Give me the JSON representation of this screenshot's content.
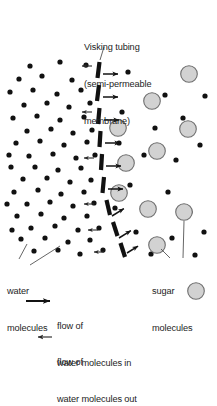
{
  "figure": {
    "title_lines": [
      "Visking tubing",
      "(semi-permeable",
      "membrane)"
    ],
    "title_text": "Visking tubing (semi-permeable membrane)",
    "caption_faint": "",
    "background_color": "#ffffff",
    "ink_color": "#1a1a1a"
  },
  "labels": {
    "water": {
      "line1": "water",
      "line2": "molecules"
    },
    "sugar": {
      "line1": "sugar",
      "line2": "molecules"
    }
  },
  "legend": {
    "flow_in": {
      "line1": "flow of",
      "line2": "water molecules in",
      "arrow": "arrow-right-thick",
      "direction": "right"
    },
    "flow_out": {
      "line1": "flow of",
      "line2": "water molecules out",
      "arrow": "arrow-left-thin",
      "direction": "left"
    }
  },
  "legend_style": {
    "in_arrow_color": "#1a1a1a",
    "out_arrow_color": "#1a1a1a"
  },
  "diagram_data": {
    "type": "osmosis-schematic",
    "membrane": {
      "name": "visking-tubing-membrane",
      "style": "dashed-thick-segments",
      "color": "#111111",
      "segment_width": 4.2,
      "segments": [
        {
          "x1": 99.5,
          "y1": 62,
          "x2": 97.5,
          "y2": 78
        },
        {
          "x1": 99.0,
          "y1": 85,
          "x2": 97.0,
          "y2": 101
        },
        {
          "x1": 99.5,
          "y1": 108,
          "x2": 98.0,
          "y2": 124
        },
        {
          "x1": 100.5,
          "y1": 131,
          "x2": 99.5,
          "y2": 147
        },
        {
          "x1": 102.0,
          "y1": 154,
          "x2": 101.0,
          "y2": 170
        },
        {
          "x1": 104.0,
          "y1": 177,
          "x2": 102.5,
          "y2": 193
        },
        {
          "x1": 106.5,
          "y1": 200,
          "x2": 110.0,
          "y2": 215
        },
        {
          "x1": 113.0,
          "y1": 222,
          "x2": 117.5,
          "y2": 236
        },
        {
          "x1": 120.5,
          "y1": 243,
          "x2": 125.0,
          "y2": 257
        }
      ]
    },
    "flow_arrows_in": [
      {
        "x": 103,
        "y": 74,
        "len": 15
      },
      {
        "x": 103,
        "y": 97,
        "len": 15
      },
      {
        "x": 104,
        "y": 120,
        "len": 15
      },
      {
        "x": 105,
        "y": 143,
        "len": 15
      },
      {
        "x": 106,
        "y": 166,
        "len": 15
      },
      {
        "x": 108,
        "y": 189,
        "len": 15
      }
    ],
    "flow_arrows_in_angled": [
      {
        "x": 112,
        "y": 216,
        "len": 14,
        "angle": -32
      },
      {
        "x": 119,
        "y": 238,
        "len": 14,
        "angle": -32
      },
      {
        "x": 127,
        "y": 253,
        "len": 13,
        "angle": -32
      }
    ],
    "flow_arrows_out": [
      {
        "x": 92,
        "y": 66,
        "len": 10
      },
      {
        "x": 92,
        "y": 112,
        "len": 10
      },
      {
        "x": 94,
        "y": 158,
        "len": 10
      },
      {
        "x": 94,
        "y": 204,
        "len": 10
      },
      {
        "x": 98,
        "y": 230,
        "len": 10
      },
      {
        "x": 104,
        "y": 252,
        "len": 10
      }
    ],
    "water_molecules": {
      "name": "water-molecule-dots",
      "color": "#111111",
      "radius": 2.6,
      "points": [
        [
          30,
          66
        ],
        [
          60,
          62
        ],
        [
          86,
          65
        ],
        [
          19,
          79
        ],
        [
          42,
          76
        ],
        [
          72,
          80
        ],
        [
          10,
          92
        ],
        [
          33,
          90
        ],
        [
          57,
          94
        ],
        [
          81,
          90
        ],
        [
          24,
          105
        ],
        [
          47,
          103
        ],
        [
          69,
          107
        ],
        [
          90,
          103
        ],
        [
          13,
          118
        ],
        [
          37,
          116
        ],
        [
          60,
          120
        ],
        [
          84,
          117
        ],
        [
          27,
          131
        ],
        [
          51,
          129
        ],
        [
          73,
          133
        ],
        [
          92,
          130
        ],
        [
          16,
          143
        ],
        [
          40,
          141
        ],
        [
          64,
          145
        ],
        [
          87,
          142
        ],
        [
          29,
          156
        ],
        [
          53,
          154
        ],
        [
          76,
          158
        ],
        [
          95,
          155
        ],
        [
          11,
          167
        ],
        [
          35,
          167
        ],
        [
          58,
          170
        ],
        [
          81,
          168
        ],
        [
          23,
          179
        ],
        [
          47,
          178
        ],
        [
          70,
          182
        ],
        [
          91,
          180
        ],
        [
          14,
          192
        ],
        [
          38,
          190
        ],
        [
          61,
          194
        ],
        [
          84,
          192
        ],
        [
          27,
          204
        ],
        [
          50,
          202
        ],
        [
          73,
          206
        ],
        [
          94,
          203
        ],
        [
          17,
          216
        ],
        [
          41,
          214
        ],
        [
          64,
          218
        ],
        [
          87,
          216
        ],
        [
          31,
          228
        ],
        [
          55,
          226
        ],
        [
          78,
          230
        ],
        [
          99,
          228
        ],
        [
          21,
          239
        ],
        [
          45,
          238
        ],
        [
          68,
          242
        ],
        [
          90,
          240
        ],
        [
          34,
          251
        ],
        [
          58,
          250
        ],
        [
          80,
          254
        ],
        [
          103,
          250
        ],
        [
          12,
          230
        ],
        [
          7,
          204
        ],
        [
          9,
          155
        ]
      ],
      "points_right_side": [
        [
          128,
          72
        ],
        [
          165,
          95
        ],
        [
          155,
          128
        ],
        [
          122,
          112
        ],
        [
          183,
          118
        ],
        [
          144,
          155
        ],
        [
          176,
          160
        ],
        [
          130,
          185
        ],
        [
          168,
          192
        ],
        [
          200,
          145
        ],
        [
          205,
          96
        ],
        [
          119,
          143
        ],
        [
          190,
          212
        ],
        [
          136,
          232
        ],
        [
          172,
          238
        ],
        [
          204,
          232
        ],
        [
          151,
          254
        ],
        [
          195,
          255
        ],
        [
          115,
          208
        ]
      ]
    },
    "sugar_molecules": {
      "name": "sugar-molecule-circles",
      "fill": "#d2d2d2",
      "stroke": "#6e6e6e",
      "radius": 8.3,
      "points": [
        [
          189,
          74
        ],
        [
          152,
          101
        ],
        [
          118,
          128
        ],
        [
          188,
          129
        ],
        [
          126,
          163
        ],
        [
          157,
          151
        ],
        [
          119,
          193
        ],
        [
          148,
          209
        ],
        [
          184,
          212
        ],
        [
          157,
          245
        ],
        [
          196,
          291
        ]
      ]
    },
    "leader_lines": [
      {
        "name": "title-leader",
        "x1": 104,
        "y1": 47,
        "x2": 100,
        "y2": 60
      },
      {
        "name": "water-leader-a",
        "x1": 19,
        "y1": 259,
        "x2": 27,
        "y2": 244
      },
      {
        "name": "water-leader-b",
        "x1": 30,
        "y1": 265,
        "x2": 60,
        "y2": 246
      },
      {
        "name": "sugar-leader-a",
        "x1": 170,
        "y1": 258,
        "x2": 161,
        "y2": 249
      },
      {
        "name": "sugar-leader-b",
        "x1": 183,
        "y1": 258,
        "x2": 184,
        "y2": 221
      }
    ]
  }
}
